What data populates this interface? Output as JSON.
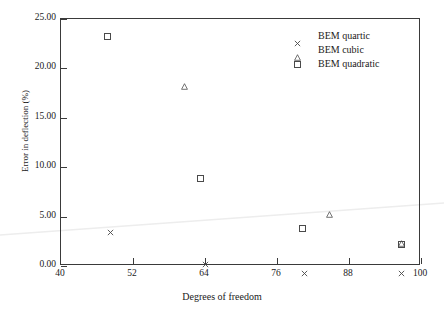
{
  "chart_data": {
    "type": "scatter",
    "title": "",
    "xlabel": "Degrees of freedom",
    "ylabel": "Error in deflection (%)",
    "xlim": [
      40,
      100
    ],
    "ylim": [
      0.0,
      25.0
    ],
    "xticks": [
      "40",
      "52",
      "64",
      "76",
      "88",
      "100"
    ],
    "xtick_values": [
      40,
      52,
      64,
      76,
      88,
      100
    ],
    "yticks": [
      "0.00",
      "5.00",
      "10.00",
      "15.00",
      "20.00",
      "25.00"
    ],
    "ytick_values": [
      0.0,
      5.0,
      10.0,
      15.0,
      20.0,
      25.0
    ],
    "grid": false,
    "legend_position": "top-right",
    "series": [
      {
        "name": "BEM quartic",
        "marker": "x",
        "points": [
          {
            "x": 48.3,
            "y": 4.1
          },
          {
            "x": 64.0,
            "y": 0.9
          },
          {
            "x": 80.5,
            "y": 0.0
          },
          {
            "x": 96.7,
            "y": 0.0
          }
        ]
      },
      {
        "name": "BEM cubic",
        "marker": "triangle",
        "points": [
          {
            "x": 60.5,
            "y": 18.9
          },
          {
            "x": 84.7,
            "y": 5.9
          },
          {
            "x": 96.7,
            "y": 3.0
          }
        ]
      },
      {
        "name": "BEM quadratic",
        "marker": "square",
        "points": [
          {
            "x": 47.8,
            "y": 23.2
          },
          {
            "x": 63.3,
            "y": 8.9
          },
          {
            "x": 80.3,
            "y": 3.8
          },
          {
            "x": 96.7,
            "y": 2.2
          }
        ]
      }
    ]
  },
  "legend": {
    "entries": [
      {
        "label": "BEM quartic",
        "marker": "x-marker-icon"
      },
      {
        "label": "BEM cubic",
        "marker": "triangle-marker-icon"
      },
      {
        "label": "BEM quadratic",
        "marker": "square-marker-icon"
      }
    ]
  },
  "axes": {
    "x_title": "Degrees of freedom",
    "y_title": "Error in deflection (%)",
    "x_tick_labels": [
      "40",
      "52",
      "64",
      "76",
      "88",
      "100"
    ],
    "y_tick_labels": [
      "0.00",
      "5.00",
      "10.00",
      "15.00",
      "20.00",
      "25.00"
    ]
  },
  "colors": {
    "axis": "#3a3a3a",
    "marker": "#4a4a4a",
    "text": "#1a1a1a",
    "background": "#ffffff",
    "scan_artifact": "#efefef"
  }
}
